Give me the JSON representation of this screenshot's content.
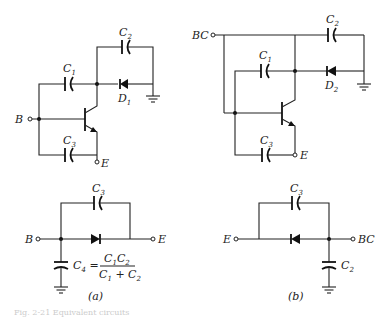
{
  "figure": {
    "panel_a": {
      "label": "(a)",
      "top_circuit": {
        "capacitors": [
          "C1",
          "C2",
          "C3"
        ],
        "diode": "D1",
        "terminals": [
          "B",
          "E"
        ]
      },
      "equivalent": {
        "capacitors": [
          "C3",
          "C4"
        ],
        "formula_lhs": "C4 =",
        "formula_numerator": "C1C2",
        "formula_denominator": "C1 + C2",
        "terminals": [
          "B",
          "E"
        ]
      }
    },
    "panel_b": {
      "label": "(b)",
      "top_circuit": {
        "capacitors": [
          "C1",
          "C2",
          "C3"
        ],
        "diode": "D2",
        "terminals": [
          "BC",
          "E"
        ]
      },
      "equivalent": {
        "capacitors": [
          "C3",
          "C2"
        ],
        "terminals": [
          "E",
          "BC"
        ]
      }
    },
    "caption": "Fig. 2-21  Equivalent circuits"
  }
}
